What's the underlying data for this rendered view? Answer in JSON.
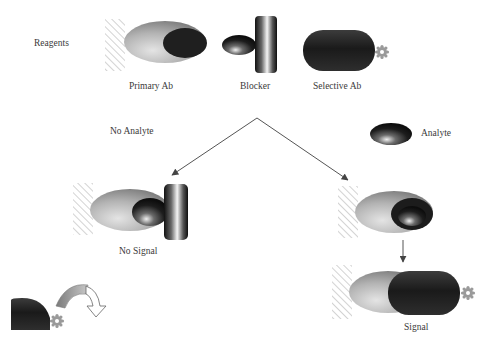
{
  "diagram": {
    "type": "immunoassay-schematic",
    "labels": {
      "reagents": "Reagents",
      "primary_ab": "Primary Ab",
      "blocker": "Blocker",
      "selective_ab": "Selective Ab",
      "no_analyte": "No Analyte",
      "analyte": "Analyte",
      "no_signal": "No Signal",
      "signal": "Signal"
    },
    "nodes": [
      {
        "id": "primary-ab",
        "label": "Primary Ab",
        "shape": "ellipse-on-surface"
      },
      {
        "id": "blocker",
        "label": "Blocker",
        "shape": "small-ellipse-with-bar"
      },
      {
        "id": "selective-ab",
        "label": "Selective Ab",
        "shape": "capsule-with-tag"
      },
      {
        "id": "analyte",
        "label": "Analyte",
        "shape": "small-ellipse"
      },
      {
        "id": "no-signal-complex",
        "label": "No Signal"
      },
      {
        "id": "bound-analyte-complex",
        "label": ""
      },
      {
        "id": "signal-complex",
        "label": "Signal"
      },
      {
        "id": "tag-release",
        "label": ""
      }
    ],
    "edges": [
      {
        "from": "reagents",
        "to": "no-signal-complex",
        "condition": "No Analyte"
      },
      {
        "from": "reagents",
        "to": "bound-analyte-complex",
        "condition": "Analyte"
      },
      {
        "from": "bound-analyte-complex",
        "to": "signal-complex"
      }
    ],
    "colors": {
      "background": "#ffffff",
      "surface_hatch": "#b8b8b8",
      "light_gray": "#c8c8c8",
      "mid_gray": "#8a8a8a",
      "dark": "#1e1e1e",
      "arrow": "#555555",
      "tag": "#9a9a9a"
    }
  }
}
